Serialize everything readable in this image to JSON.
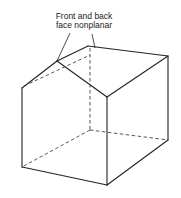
{
  "figure": {
    "annotation": {
      "line1": "Front and back",
      "line2": "face nonplanar"
    },
    "colors": {
      "line": "#222222",
      "background": "#ffffff"
    },
    "shape": "box-with-nonplanar-gabled-top",
    "solid_edges": [
      [
        [
          22,
          88
        ],
        [
          57,
          61
        ]
      ],
      [
        [
          57,
          61
        ],
        [
          88,
          46
        ]
      ],
      [
        [
          88,
          46
        ],
        [
          168,
          56
        ]
      ],
      [
        [
          57,
          61
        ],
        [
          107,
          97
        ]
      ],
      [
        [
          107,
          97
        ],
        [
          168,
          56
        ]
      ],
      [
        [
          22,
          88
        ],
        [
          22,
          167
        ]
      ],
      [
        [
          107,
          97
        ],
        [
          107,
          185
        ]
      ],
      [
        [
          168,
          56
        ],
        [
          168,
          140
        ]
      ],
      [
        [
          22,
          167
        ],
        [
          107,
          185
        ]
      ],
      [
        [
          107,
          185
        ],
        [
          168,
          140
        ]
      ]
    ],
    "hidden_edges": [
      [
        [
          88,
          46
        ],
        [
          90,
          130
        ]
      ],
      [
        [
          90,
          130
        ],
        [
          22,
          167
        ]
      ],
      [
        [
          90,
          130
        ],
        [
          168,
          140
        ]
      ],
      [
        [
          22,
          88
        ],
        [
          88,
          56
        ]
      ]
    ],
    "leaders": [
      [
        [
          70,
          33
        ],
        [
          57,
          61
        ]
      ],
      [
        [
          92,
          34
        ],
        [
          96,
          48
        ]
      ]
    ]
  }
}
